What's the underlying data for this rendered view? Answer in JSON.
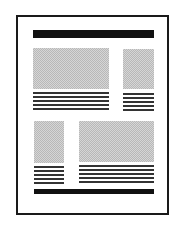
{
  "diagram": {
    "type": "page-layout-wireframe",
    "colors": {
      "frame": "#1a1a1a",
      "bar": "#111111",
      "image_fill": "#c8c8c8",
      "text_line": "#333333"
    },
    "header_bar": {
      "present": true
    },
    "footer_bar": {
      "present": true
    },
    "blocks": [
      {
        "position": "top-left",
        "kind": "image-with-text",
        "text_lines": 5
      },
      {
        "position": "top-right",
        "kind": "image-with-text",
        "text_lines": 5
      },
      {
        "position": "bottom-left",
        "kind": "image-with-text",
        "text_lines": 5
      },
      {
        "position": "bottom-right",
        "kind": "image-with-text",
        "text_lines": 6
      }
    ]
  }
}
